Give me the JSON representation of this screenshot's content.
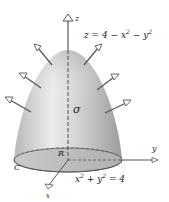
{
  "figure": {
    "equation_surface": "z = 4 − x² − y²",
    "equation_surface_parts": {
      "lhs": "z = 4 − x",
      "exp1": "2",
      "mid": " − y",
      "exp2": "2"
    },
    "equation_boundary": "x² + y² = 4",
    "equation_boundary_parts": {
      "a": "x",
      "exp1": "2",
      "b": " + y",
      "exp2": "2",
      "c": " = 4"
    },
    "labels": {
      "z_axis": "z",
      "y_axis": "y",
      "x_axis": "x",
      "surface": "σ",
      "region": "R",
      "curve": "C"
    },
    "colors": {
      "surface_light": "#e8e8e8",
      "surface_mid": "#c4c4c4",
      "surface_dark": "#9a9a9a",
      "base_fill": "#bdbdbd",
      "axis": "#555555",
      "arrow": "#555555",
      "text": "#222222",
      "background": "#ffffff"
    },
    "normal_vectors_count": 6
  }
}
